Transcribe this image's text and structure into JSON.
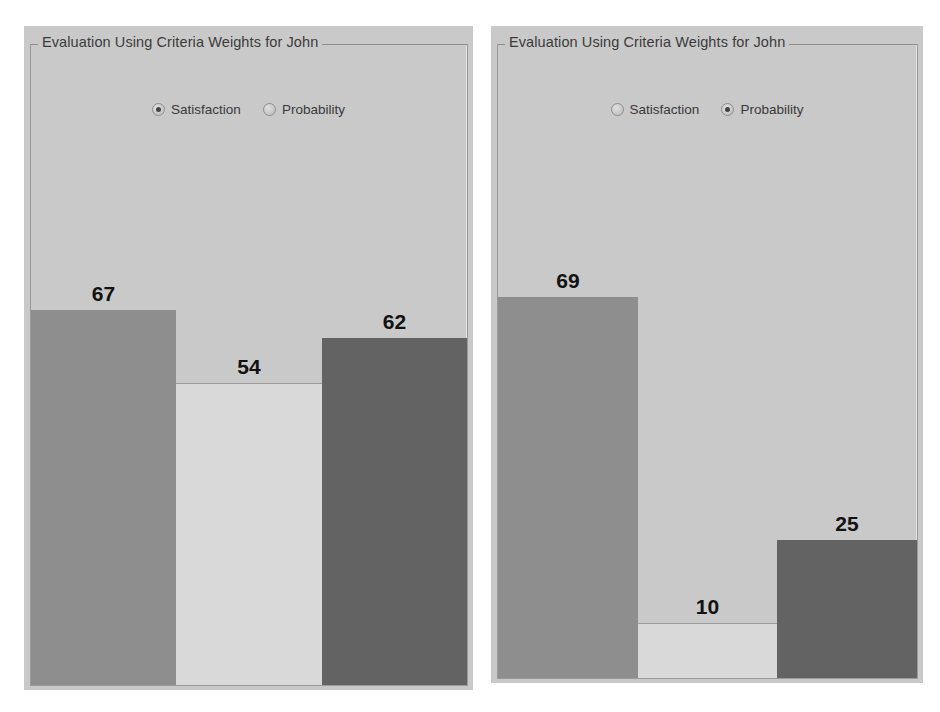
{
  "panels": [
    {
      "title": "Evaluation Using Criteria Weights for John",
      "radios": [
        {
          "label": "Satisfaction",
          "selected": true
        },
        {
          "label": "Probability",
          "selected": false
        }
      ],
      "chart_data": {
        "type": "bar",
        "title": "Evaluation Using Criteria Weights for John",
        "categories": [
          "Bar 1",
          "Bar 2",
          "Bar 3"
        ],
        "values": [
          67,
          54,
          62
        ],
        "value_labels": [
          "67",
          "54",
          "62"
        ],
        "colors": [
          "#8e8e8e",
          "#d9d9d9",
          "#636363"
        ],
        "xlabel": "",
        "ylabel": "",
        "ylim": [
          0,
          100
        ],
        "grid": false,
        "legend": "none"
      }
    },
    {
      "title": "Evaluation Using Criteria Weights for John",
      "radios": [
        {
          "label": "Satisfaction",
          "selected": false
        },
        {
          "label": "Probability",
          "selected": true
        }
      ],
      "chart_data": {
        "type": "bar",
        "title": "Evaluation Using Criteria Weights for John",
        "categories": [
          "Bar 1",
          "Bar 2",
          "Bar 3"
        ],
        "values": [
          69,
          10,
          25
        ],
        "value_labels": [
          "69",
          "10",
          "25"
        ],
        "colors": [
          "#8e8e8e",
          "#d9d9d9",
          "#636363"
        ],
        "xlabel": "",
        "ylabel": "",
        "ylim": [
          0,
          100
        ],
        "grid": false,
        "legend": "none"
      }
    }
  ],
  "theme": {
    "panel_background": "#c9c9c9",
    "bar_color_1": "#8e8e8e",
    "bar_color_2": "#d9d9d9",
    "bar_color_3": "#636363",
    "label_color": "#121212",
    "title_color": "#3b3b3b"
  }
}
